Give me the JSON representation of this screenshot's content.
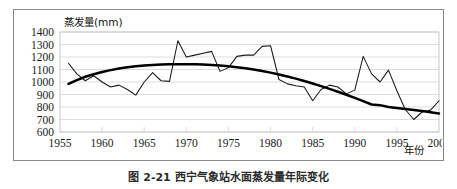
{
  "figure": {
    "caption": "图 2-21  西宁气象站水面蒸发量年际变化",
    "border_color": "#8a8a8a",
    "background": "#ffffff"
  },
  "chart_data": {
    "type": "line",
    "title": "",
    "xlabel": "年份",
    "ylabel": "蒸发量(mm)",
    "y_axis_title": "蒸发量(mm)",
    "x_axis_title": "年份",
    "xlim": [
      1955,
      2000
    ],
    "ylim": [
      600,
      1400
    ],
    "ytick_step": 100,
    "xtick_step": 5,
    "grid": true,
    "legend": "none",
    "yticks": [
      1400,
      1300,
      1200,
      1100,
      1000,
      900,
      800,
      700,
      600
    ],
    "xticks": [
      1955,
      1960,
      1965,
      1970,
      1975,
      1980,
      1985,
      1990,
      1995,
      2000
    ],
    "x": [
      1956,
      1957,
      1958,
      1959,
      1960,
      1961,
      1962,
      1963,
      1964,
      1965,
      1966,
      1967,
      1968,
      1969,
      1970,
      1971,
      1972,
      1973,
      1974,
      1975,
      1976,
      1977,
      1978,
      1979,
      1980,
      1981,
      1982,
      1983,
      1984,
      1985,
      1986,
      1987,
      1988,
      1989,
      1990,
      1991,
      1992,
      1993,
      1994,
      1995,
      1996,
      1997,
      1998,
      1999,
      2000
    ],
    "series": [
      {
        "name": "年蒸发量",
        "style": "thin-line",
        "color": "#1a1a1a",
        "values": [
          1150,
          1065,
          1010,
          1050,
          1000,
          960,
          975,
          940,
          895,
          1000,
          1075,
          1010,
          1005,
          1330,
          1200,
          1215,
          1230,
          1245,
          1085,
          1115,
          1205,
          1215,
          1215,
          1285,
          1290,
          1020,
          985,
          970,
          960,
          850,
          940,
          975,
          960,
          905,
          935,
          1205,
          1065,
          1000,
          1095,
          930,
          780,
          700,
          760,
          775,
          850
        ]
      },
      {
        "name": "趋势线",
        "style": "thick-trend",
        "color": "#000000",
        "values": [
          985,
          1015,
          1042,
          1062,
          1080,
          1095,
          1108,
          1118,
          1126,
          1132,
          1137,
          1140,
          1142,
          1143,
          1143,
          1142,
          1140,
          1137,
          1132,
          1126,
          1118,
          1110,
          1100,
          1088,
          1075,
          1060,
          1044,
          1027,
          1008,
          988,
          967,
          945,
          922,
          898,
          873,
          847,
          820,
          815,
          800,
          792,
          784,
          776,
          768,
          758,
          748
        ]
      }
    ]
  }
}
